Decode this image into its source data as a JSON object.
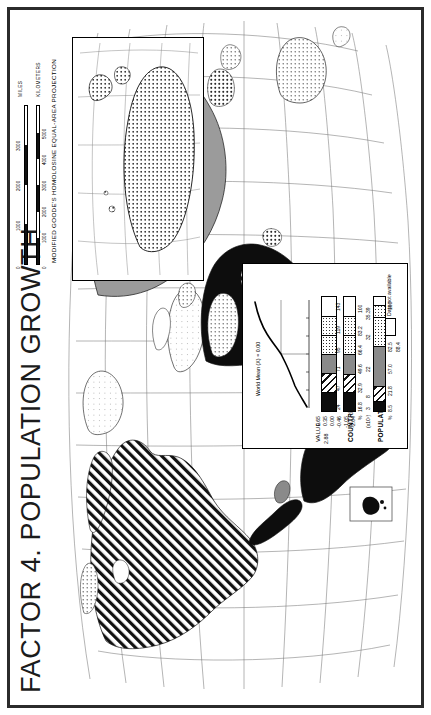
{
  "title": "FACTOR 4. POPULATION GROWTH",
  "projection": {
    "caption": "MODIFIED GOODE'S HOMOLOSINE EQUAL-AREA PROJECTION",
    "scale_miles_label": "MILES",
    "scale_km_label": "KILOMETERS",
    "miles_ticks": [
      "0",
      "1000",
      "2000",
      "3000",
      "4000"
    ],
    "km_ticks": [
      "0",
      "1000",
      "2000",
      "3000",
      "4000",
      "5000",
      "6000"
    ]
  },
  "legend": {
    "curve_annotation": "World Mean (X) = 0.00",
    "value_title": "VALUE",
    "value_max": "2.88",
    "class_breaks": [
      "0.65",
      "0.35",
      "0.00",
      "-0.46",
      "-1.05",
      "-2.04"
    ],
    "classes": [
      {
        "name": "class-1-highest",
        "pattern": "solid-black"
      },
      {
        "name": "class-2",
        "pattern": "diagonal-hatch"
      },
      {
        "name": "class-3",
        "pattern": "solid-gray"
      },
      {
        "name": "class-4",
        "pattern": "coarse-dots"
      },
      {
        "name": "class-5",
        "pattern": "fine-dots"
      },
      {
        "name": "class-6-lowest",
        "pattern": "light-stipple"
      }
    ],
    "countries": {
      "label": "COUNTRIES",
      "axis_label": "%",
      "counts": [
        "24",
        "47",
        "71",
        "95",
        "119",
        "143"
      ],
      "cumulative_percent": [
        "16.8",
        "32.9",
        "49.6",
        "66.4",
        "83.2",
        "100"
      ],
      "segment_percent": [
        16.8,
        16.1,
        16.7,
        16.8,
        16.8,
        16.8
      ]
    },
    "population": {
      "label": "POPULATION",
      "axis_label": "%",
      "axis_unit": "(x10⁷)",
      "counts": [
        "3",
        "8",
        "22",
        "32",
        "35.39"
      ],
      "cumulative_percent": [
        "8.5",
        "21.8",
        "57.0",
        "82.5",
        "100"
      ],
      "segment_percent": [
        8.5,
        13.3,
        35.2,
        25.5,
        10.1,
        7.4
      ],
      "extra_tick": "88.4"
    },
    "no_data_label": "Data not available"
  },
  "map": {
    "inset_name": "antarctica-inset",
    "detail_inset_name": "caribbean-detail-inset",
    "graticule": true
  },
  "colors": {
    "frame": "#2b2b2b",
    "class_black": "#0d0d0d",
    "class_gray": "#8a8a8a",
    "background": "#ffffff",
    "line": "#000000"
  }
}
